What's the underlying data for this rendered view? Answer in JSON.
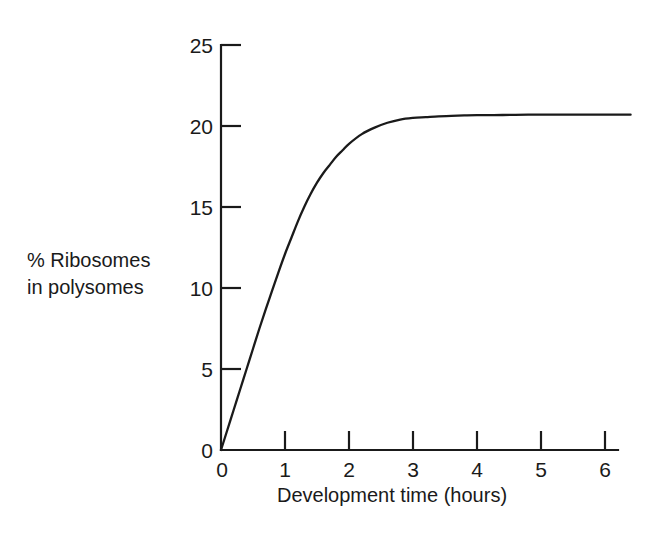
{
  "chart_data": {
    "type": "line",
    "title": "",
    "xlabel": "Development time (hours)",
    "ylabel": "% Ribosomes in polysomes",
    "ylabel_line1": "% Ribosomes",
    "ylabel_line2": "in polysomes",
    "xlim": [
      0,
      6.4
    ],
    "ylim": [
      0,
      25
    ],
    "xticks": [
      0,
      1,
      2,
      3,
      4,
      5,
      6
    ],
    "yticks": [
      0,
      5,
      10,
      15,
      20,
      25
    ],
    "xtick_labels": [
      "0",
      "1",
      "2",
      "3",
      "4",
      "5",
      "6"
    ],
    "ytick_labels": [
      "0",
      "5",
      "10",
      "15",
      "20",
      "25"
    ],
    "grid": false,
    "legend": "none",
    "series": [
      {
        "name": "% Ribosomes in polysomes",
        "color": "#1a1a1a",
        "x": [
          0.0,
          0.1,
          0.2,
          0.3,
          0.4,
          0.5,
          0.6,
          0.7,
          0.8,
          0.9,
          1.0,
          1.1,
          1.2,
          1.3,
          1.4,
          1.5,
          1.6,
          1.7,
          1.8,
          1.9,
          2.0,
          2.2,
          2.4,
          2.6,
          2.8,
          3.0,
          3.2,
          3.4,
          3.6,
          3.8,
          4.0,
          4.4,
          4.8,
          5.2,
          5.6,
          6.0,
          6.4
        ],
        "y": [
          0.0,
          1.25,
          2.5,
          3.75,
          5.0,
          6.25,
          7.5,
          8.7,
          9.85,
          11.0,
          12.1,
          13.1,
          14.1,
          15.0,
          15.8,
          16.5,
          17.1,
          17.6,
          18.1,
          18.5,
          18.9,
          19.5,
          19.9,
          20.2,
          20.4,
          20.5,
          20.55,
          20.6,
          20.62,
          20.65,
          20.67,
          20.68,
          20.7,
          20.7,
          20.7,
          20.7,
          20.7
        ]
      }
    ],
    "annotations": {
      "plateau_value": 20.7,
      "y_axis_origin_label": "0",
      "x_axis_origin_label": "0"
    }
  },
  "figure": {
    "background_color": "#ffffff",
    "line_color": "#1a1a1a"
  }
}
